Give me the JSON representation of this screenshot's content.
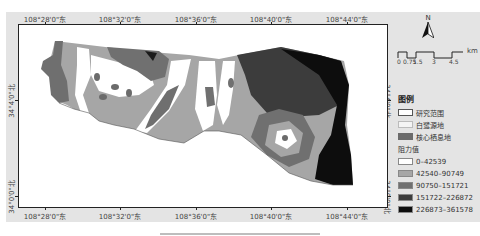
{
  "figure": {
    "panel_bg": "#e4e4e4",
    "longitude_labels": [
      {
        "text": "108°28'0\"东",
        "x": 45
      },
      {
        "text": "108°32'0\"东",
        "x": 120
      },
      {
        "text": "108°36'0\"东",
        "x": 196
      },
      {
        "text": "108°40'0\"东",
        "x": 271
      },
      {
        "text": "108°44'0\"东",
        "x": 347
      }
    ],
    "latitude_labels": [
      {
        "text": "34°4'0\"北",
        "y": 100
      },
      {
        "text": "34°0'0\"北",
        "y": 196
      }
    ],
    "north_arrow": {
      "label": "N"
    },
    "scale_bar": {
      "unit": "km",
      "ticks": [
        "0",
        "0.75",
        "1.5",
        "3",
        "4.5"
      ]
    },
    "legend": {
      "title": "图例",
      "items": [
        {
          "label": "研究范围",
          "color": "#ffffff",
          "border": "#555555"
        },
        {
          "label": "白鹭源地",
          "color": "#f4f4f4",
          "border": "#bbbbbb"
        },
        {
          "label": "核心栖息地",
          "color": "#6b6b6b",
          "border": "#6b6b6b"
        }
      ],
      "resistance_title": "阻力值",
      "resistance_classes": [
        {
          "label": "0–42539",
          "color": "#ffffff"
        },
        {
          "label": "42540–90749",
          "color": "#a6a6a6"
        },
        {
          "label": "90750–151721",
          "color": "#707070"
        },
        {
          "label": "151722–226872",
          "color": "#3c3c3c"
        },
        {
          "label": "226873–361578",
          "color": "#0d0d0d"
        }
      ]
    }
  }
}
